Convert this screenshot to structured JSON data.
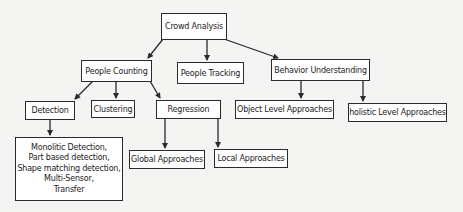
{
  "diagram": {
    "type": "tree",
    "colors": {
      "border": "#2a2a2a",
      "fill": "#ffffff",
      "background": "#f4f4f2",
      "text": "#222222"
    },
    "root": {
      "id": "crowd-analysis",
      "label": "Crowd Analysis"
    },
    "level1": [
      {
        "id": "people-counting",
        "label": "People Counting"
      },
      {
        "id": "people-tracking",
        "label": "People Tracking"
      },
      {
        "id": "behavior-understanding",
        "label": "Behavior Understanding"
      }
    ],
    "level2": {
      "detection": {
        "label": "Detection"
      },
      "clustering": {
        "label": "Clustering"
      },
      "regression": {
        "label": "Regression"
      },
      "object_level": {
        "label": "Object Level Approaches"
      },
      "holistic_level": {
        "label": "holistic Level Approaches"
      }
    },
    "level3": {
      "detection_methods": {
        "lines": [
          "Monolitic Detection,",
          "Part based detection,",
          "Shape matching detection,",
          "Multi-Sensor,",
          "Transfer"
        ]
      },
      "global": {
        "label": "Global Approaches"
      },
      "local": {
        "label": "Local Approaches"
      }
    },
    "edges": [
      [
        "Crowd Analysis",
        "People Counting"
      ],
      [
        "Crowd Analysis",
        "People Tracking"
      ],
      [
        "Crowd Analysis",
        "Behavior Understanding"
      ],
      [
        "People Counting",
        "Detection"
      ],
      [
        "People Counting",
        "Clustering"
      ],
      [
        "People Counting",
        "Regression"
      ],
      [
        "Behavior Understanding",
        "Object Level Approaches"
      ],
      [
        "Behavior Understanding",
        "holistic Level Approaches"
      ],
      [
        "Detection",
        "Monolitic Detection, Part based detection, Shape matching detection, Multi-Sensor, Transfer"
      ],
      [
        "Regression",
        "Global Approaches"
      ],
      [
        "Regression",
        "Local Approaches"
      ]
    ]
  }
}
